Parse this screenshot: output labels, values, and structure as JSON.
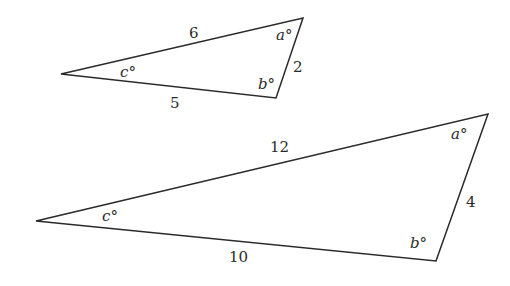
{
  "figure": {
    "small_triangle": {
      "vertices": {
        "left": [
          61,
          74
        ],
        "top_right": [
          303,
          18
        ],
        "bottom": [
          276,
          98
        ]
      },
      "sides": {
        "top": "6",
        "right": "2",
        "bottom": "5"
      },
      "angles": {
        "a": "a°",
        "b": "b°",
        "c": "c°"
      }
    },
    "large_triangle": {
      "vertices": {
        "left": [
          36,
          221
        ],
        "top_right": [
          488,
          114
        ],
        "bottom": [
          436,
          261
        ]
      },
      "sides": {
        "top": "12",
        "right": "4",
        "bottom": "10"
      },
      "angles": {
        "a": "a°",
        "b": "b°",
        "c": "c°"
      }
    }
  }
}
